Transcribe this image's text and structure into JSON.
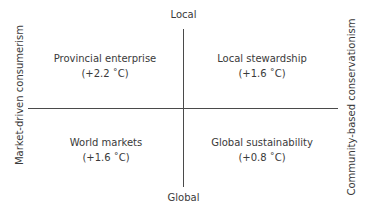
{
  "diagram": {
    "type": "scenario-quadrant",
    "axes": {
      "vertical": {
        "top_label": "Local",
        "bottom_label": "Global"
      },
      "horizontal": {
        "left_label": "Market-driven consumerism",
        "right_label": "Community-based conservationism"
      }
    },
    "quadrants": [
      {
        "position": "top-left",
        "name": "Provincial enterprise",
        "warming": "(+2.2 ˚C)"
      },
      {
        "position": "top-right",
        "name": "Local stewardship",
        "warming": "(+1.6 ˚C)"
      },
      {
        "position": "bottom-left",
        "name": "World markets",
        "warming": "(+1.6 ˚C)"
      },
      {
        "position": "bottom-right",
        "name": "Global sustainability",
        "warming": "(+0.8 ˚C)"
      }
    ],
    "colors": {
      "axis_line": "#4a4a4a",
      "text": "#3a3a3a",
      "background": "#ffffff"
    }
  }
}
